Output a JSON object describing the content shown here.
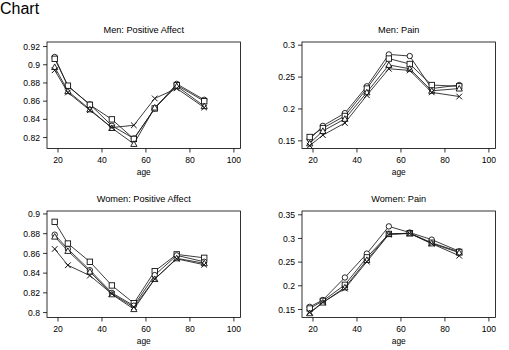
{
  "figure": {
    "background": "#ffffff",
    "ink": "#000000",
    "layout": "2x2 panel grid"
  },
  "chart_data": [
    {
      "id": "men-positive-affect",
      "type": "line",
      "title": "Men: Positive Affect",
      "xlabel": "age",
      "ylabel": "",
      "xlim": [
        15,
        103
      ],
      "ylim": [
        0.808,
        0.925
      ],
      "xticks": [
        20,
        40,
        60,
        80,
        100
      ],
      "yticks": [
        0.82,
        0.84,
        0.86,
        0.88,
        0.9,
        0.92
      ],
      "ytick_labels": [
        "0.82",
        "0.84",
        "0.86",
        "0.88",
        "0.9",
        "0.92"
      ],
      "grid": false,
      "legend": "none",
      "x": [
        18.5,
        24.5,
        34.5,
        44.5,
        54.5,
        64.0,
        74.0,
        86.5
      ],
      "series": [
        {
          "name": "circle",
          "marker": "circle",
          "values": [
            0.9085,
            0.8765,
            0.8565,
            0.833,
            0.819,
            0.852,
            0.879,
            0.8615
          ]
        },
        {
          "name": "square",
          "marker": "square",
          "values": [
            0.9065,
            0.877,
            0.856,
            0.84,
            0.8185,
            0.852,
            0.8775,
            0.86
          ]
        },
        {
          "name": "triangle",
          "marker": "triangle",
          "values": [
            0.8975,
            0.871,
            0.851,
            0.8305,
            0.813,
            0.853,
            0.8765,
            0.8545
          ]
        },
        {
          "name": "cross",
          "marker": "x",
          "values": [
            0.894,
            0.8695,
            0.85,
            0.831,
            0.8335,
            0.863,
            0.874,
            0.853
          ]
        }
      ]
    },
    {
      "id": "men-pain",
      "type": "line",
      "title": "Men: Pain",
      "xlabel": "age",
      "ylabel": "",
      "xlim": [
        15,
        103
      ],
      "ylim": [
        0.138,
        0.305
      ],
      "xticks": [
        20,
        40,
        60,
        80,
        100
      ],
      "yticks": [
        0.15,
        0.2,
        0.25,
        0.3
      ],
      "ytick_labels": [
        "0.15",
        "0.2",
        "0.25",
        "0.3"
      ],
      "grid": false,
      "legend": "none",
      "x": [
        18.5,
        24.5,
        34.5,
        44.5,
        54.5,
        64.0,
        74.0,
        86.5
      ],
      "series": [
        {
          "name": "circle",
          "marker": "circle",
          "values": [
            0.1525,
            0.1735,
            0.1935,
            0.2355,
            0.2855,
            0.283,
            0.232,
            0.2375
          ]
        },
        {
          "name": "square",
          "marker": "square",
          "values": [
            0.156,
            0.17,
            0.189,
            0.232,
            0.279,
            0.2705,
            0.2375,
            0.2355
          ]
        },
        {
          "name": "triangle",
          "marker": "triangle",
          "values": [
            0.146,
            0.1655,
            0.1845,
            0.226,
            0.269,
            0.263,
            0.2285,
            0.232
          ]
        },
        {
          "name": "cross",
          "marker": "x",
          "values": [
            0.1425,
            0.159,
            0.178,
            0.2215,
            0.263,
            0.2605,
            0.226,
            0.2195
          ]
        }
      ]
    },
    {
      "id": "women-positive-affect",
      "type": "line",
      "title": "Women: Positive Affect",
      "xlabel": "age",
      "ylabel": "",
      "xlim": [
        15,
        103
      ],
      "ylim": [
        0.795,
        0.903
      ],
      "xticks": [
        20,
        40,
        60,
        80,
        100
      ],
      "yticks": [
        0.8,
        0.82,
        0.84,
        0.86,
        0.88,
        0.9
      ],
      "ytick_labels": [
        "0.8",
        "0.82",
        "0.84",
        "0.86",
        "0.88",
        "0.9"
      ],
      "grid": false,
      "legend": "none",
      "x": [
        18.5,
        24.5,
        34.5,
        44.5,
        54.5,
        64.0,
        74.0,
        86.5
      ],
      "series": [
        {
          "name": "square",
          "marker": "square",
          "values": [
            0.892,
            0.87,
            0.8515,
            0.8275,
            0.8095,
            0.842,
            0.859,
            0.8555
          ]
        },
        {
          "name": "circle",
          "marker": "circle",
          "values": [
            0.879,
            0.8645,
            0.843,
            0.82,
            0.807,
            0.838,
            0.858,
            0.8515
          ]
        },
        {
          "name": "triangle",
          "marker": "triangle",
          "values": [
            0.877,
            0.8625,
            0.8415,
            0.8185,
            0.8035,
            0.834,
            0.855,
            0.85
          ]
        },
        {
          "name": "cross",
          "marker": "x",
          "values": [
            0.8645,
            0.848,
            0.8375,
            0.819,
            0.8055,
            0.834,
            0.8545,
            0.8485
          ]
        }
      ]
    },
    {
      "id": "women-pain",
      "type": "line",
      "title": "Women: Pain",
      "xlabel": "age",
      "ylabel": "",
      "xlim": [
        15,
        103
      ],
      "ylim": [
        0.133,
        0.358
      ],
      "xticks": [
        20,
        40,
        60,
        80,
        100
      ],
      "yticks": [
        0.15,
        0.2,
        0.25,
        0.3,
        0.35
      ],
      "ytick_labels": [
        "0.15",
        "0.2",
        "0.25",
        "0.3",
        "0.35"
      ],
      "grid": false,
      "legend": "none",
      "x": [
        18.5,
        24.5,
        34.5,
        44.5,
        54.5,
        64.0,
        74.0,
        86.5
      ],
      "series": [
        {
          "name": "circle",
          "marker": "circle",
          "values": [
            0.1555,
            0.17,
            0.2175,
            0.268,
            0.3255,
            0.3125,
            0.2975,
            0.273
          ]
        },
        {
          "name": "square",
          "marker": "square",
          "values": [
            0.152,
            0.168,
            0.202,
            0.26,
            0.3095,
            0.311,
            0.291,
            0.2715
          ]
        },
        {
          "name": "triangle",
          "marker": "triangle",
          "values": [
            0.142,
            0.1645,
            0.1965,
            0.2545,
            0.3095,
            0.311,
            0.2895,
            0.27
          ]
        },
        {
          "name": "cross",
          "marker": "x",
          "values": [
            0.1435,
            0.165,
            0.194,
            0.251,
            0.3085,
            0.3105,
            0.289,
            0.2635
          ]
        }
      ]
    }
  ]
}
